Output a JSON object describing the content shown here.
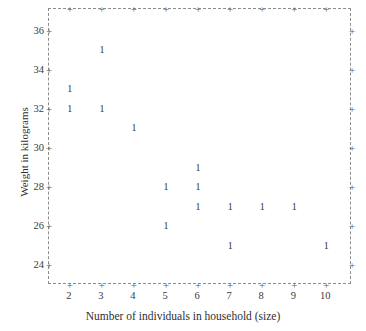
{
  "chart_data": {
    "type": "scatter",
    "title": "",
    "xlabel": "Number of individuals in household (size)",
    "ylabel": "Weight in kilograms",
    "xlim": [
      1.35,
      10.8
    ],
    "ylim": [
      23.0,
      37.1
    ],
    "xticks": [
      2,
      3,
      4,
      5,
      6,
      7,
      8,
      9,
      10
    ],
    "yticks": [
      24,
      26,
      28,
      30,
      32,
      34,
      36
    ],
    "grid": false,
    "legend": null,
    "marker_label": "1",
    "marker_note": "Each plotted glyph is the numeral 1, denoting one observation at that coordinate",
    "x": [
      3,
      2,
      2,
      3,
      4,
      6,
      5,
      6,
      6,
      7,
      8,
      9,
      5,
      7,
      10
    ],
    "y": [
      35,
      33,
      32,
      32,
      31,
      29,
      28,
      28,
      27,
      27,
      27,
      27,
      26,
      25,
      25
    ],
    "points": [
      {
        "x": 3,
        "y": 35,
        "label": "1"
      },
      {
        "x": 2,
        "y": 33,
        "label": "1"
      },
      {
        "x": 2,
        "y": 32,
        "label": "1"
      },
      {
        "x": 3,
        "y": 32,
        "label": "1"
      },
      {
        "x": 4,
        "y": 31,
        "label": "1"
      },
      {
        "x": 6,
        "y": 29,
        "label": "1"
      },
      {
        "x": 5,
        "y": 28,
        "label": "1"
      },
      {
        "x": 6,
        "y": 28,
        "label": "1"
      },
      {
        "x": 6,
        "y": 27,
        "label": "1"
      },
      {
        "x": 7,
        "y": 27,
        "label": "1"
      },
      {
        "x": 8,
        "y": 27,
        "label": "1"
      },
      {
        "x": 9,
        "y": 27,
        "label": "1"
      },
      {
        "x": 5,
        "y": 26,
        "label": "1"
      },
      {
        "x": 7,
        "y": 25,
        "label": "1"
      },
      {
        "x": 10,
        "y": 25,
        "label": "1"
      }
    ],
    "colors": {
      "background": "#ffffff",
      "frame": "#8d8d8d",
      "tick_text": "#3a3a3a",
      "marker": "#333333",
      "title_text": "#2f2f2f"
    }
  }
}
